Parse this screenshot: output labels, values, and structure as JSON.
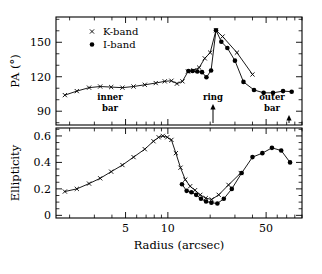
{
  "chart_data": {
    "type": "line",
    "title": "",
    "subtitle": "",
    "xlabel": "Radius (arcsec)",
    "xscale": "log",
    "xlim": [
      1.6,
      90
    ],
    "xticks": [
      5,
      10,
      50
    ],
    "xtick_labels": [
      "5",
      "10",
      "50"
    ],
    "grid": false,
    "legend_position": "upper-left",
    "panels": [
      {
        "id": "pa-panel",
        "ylabel": "PA (°)",
        "ylim": [
          78,
          172
        ],
        "yticks": [
          90,
          120,
          150
        ],
        "ytick_labels": [
          "90",
          "120",
          "150"
        ],
        "series": [
          {
            "name": "K-band",
            "marker": "cross",
            "x": [
              1.85,
              2.25,
              2.75,
              3.3,
              3.95,
              4.75,
              5.7,
              6.85,
              8.2,
              9.5,
              10.6,
              11.6,
              12.7,
              13.9,
              15.2,
              16.7,
              18.3,
              20.0,
              22.0,
              24.5,
              31.0,
              40.0
            ],
            "y": [
              104.0,
              107.5,
              110.5,
              111.5,
              111.0,
              110.5,
              111.5,
              113.0,
              114.5,
              116.0,
              116.5,
              114.0,
              116.0,
              124.5,
              125.5,
              128.0,
              136.0,
              141.0,
              160.5,
              155.0,
              141.0,
              122.0
            ]
          },
          {
            "name": "I-band",
            "marker": "dot",
            "x": [
              14.0,
              15.0,
              16.2,
              17.5,
              18.8,
              20.3,
              22.0,
              24.0,
              26.5,
              30.0,
              34.5,
              41.0,
              48.0,
              56.0,
              66.0,
              76.0
            ],
            "y": [
              125.0,
              125.0,
              124.5,
              124.0,
              119.5,
              125.5,
              160.5,
              150.5,
              145.0,
              134.0,
              115.5,
              108.5,
              106.0,
              106.0,
              107.5,
              107.0
            ]
          }
        ],
        "annotations": [
          {
            "id": "inner-bar",
            "lines": [
              "inner",
              "bar"
            ],
            "x_px": 110,
            "arrow": false
          },
          {
            "id": "ring",
            "lines": [
              "ring"
            ],
            "x_px": 213,
            "arrow": true
          },
          {
            "id": "outer-bar",
            "lines": [
              "outer",
              "bar"
            ],
            "x_px": 272,
            "arrow": true
          }
        ]
      },
      {
        "id": "ellipticity-panel",
        "ylabel": "Ellipticity",
        "ylim": [
          -0.02,
          0.66
        ],
        "yticks": [
          0,
          0.2,
          0.4,
          0.6
        ],
        "ytick_labels": [
          "0",
          "0.2",
          "0.4",
          "0.6"
        ],
        "series": [
          {
            "name": "K-band",
            "marker": "cross",
            "x": [
              1.85,
              2.25,
              2.75,
              3.3,
              3.95,
              4.75,
              5.7,
              6.85,
              7.9,
              8.6,
              9.2,
              9.9,
              10.6,
              11.4,
              12.3,
              13.3,
              14.4,
              15.6,
              17.0,
              18.6,
              20.5,
              23.0,
              27.0,
              33.0
            ],
            "y": [
              0.18,
              0.2,
              0.24,
              0.28,
              0.33,
              0.38,
              0.44,
              0.5,
              0.56,
              0.59,
              0.6,
              0.59,
              0.57,
              0.47,
              0.36,
              0.27,
              0.22,
              0.19,
              0.155,
              0.13,
              0.12,
              0.155,
              0.23,
              0.32
            ]
          },
          {
            "name": "I-band",
            "marker": "dot",
            "x": [
              12.6,
              13.6,
              14.7,
              15.9,
              17.2,
              18.7,
              20.4,
              22.5,
              25.0,
              28.5,
              33.5,
              40.0,
              47.0,
              55.0,
              64.0,
              74.0
            ],
            "y": [
              0.235,
              0.185,
              0.175,
              0.155,
              0.125,
              0.105,
              0.095,
              0.09,
              0.125,
              0.2,
              0.32,
              0.44,
              0.47,
              0.51,
              0.49,
              0.4
            ]
          }
        ],
        "annotations": []
      }
    ],
    "legend": [
      {
        "name": "K-band",
        "marker": "cross"
      },
      {
        "name": "I-band",
        "marker": "dot"
      }
    ]
  },
  "colors": {
    "ink": "#000000",
    "background": "#ffffff"
  }
}
